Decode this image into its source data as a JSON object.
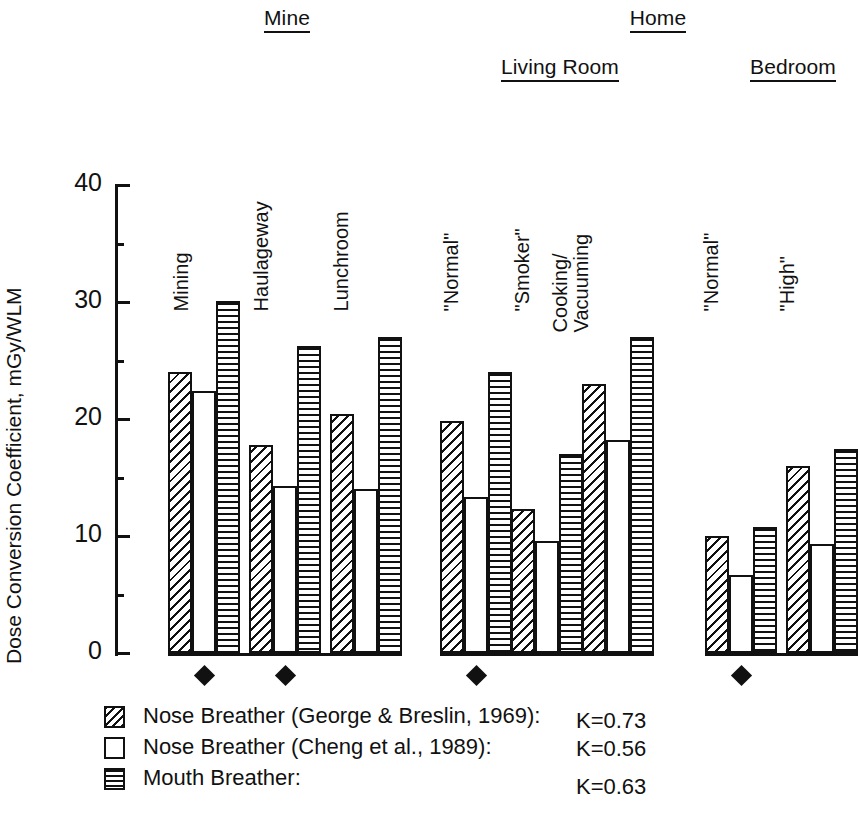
{
  "chart_data": {
    "type": "bar",
    "title": "",
    "xlabel": "",
    "ylabel": "Dose Conversion Coefficient, mGy/WLM",
    "ylim": [
      0,
      40
    ],
    "yticks": [
      0,
      10,
      20,
      30,
      40
    ],
    "yminor": [
      5,
      15,
      25,
      35
    ],
    "grid": false,
    "legend_position": "bottom-left",
    "categories": [
      "Mining",
      "Haulageway",
      "Lunchroom",
      "\"Normal\"",
      "\"Smoker\"",
      "Cooking/ Vacuuming",
      "\"Normal\"",
      "\"High\""
    ],
    "supergroups": [
      {
        "label": "Mine",
        "categories": [
          "Mining",
          "Haulageway",
          "Lunchroom"
        ]
      },
      {
        "label": "Home",
        "subgroups": [
          {
            "label": "Living Room",
            "categories": [
              "\"Normal\"",
              "\"Smoker\"",
              "Cooking/ Vacuuming"
            ]
          },
          {
            "label": "Bedroom",
            "categories": [
              "\"Normal\"",
              "\"High\""
            ]
          }
        ]
      }
    ],
    "series": [
      {
        "name": "Nose Breather (George & Breslin, 1969)",
        "pattern": "diagonal-hatch",
        "k": 0.73,
        "values": [
          24.0,
          17.8,
          20.4,
          19.8,
          12.3,
          23.0,
          10.0,
          16.0
        ]
      },
      {
        "name": "Nose Breather (Cheng et al., 1989)",
        "pattern": "open-white",
        "k": 0.56,
        "values": [
          22.4,
          14.3,
          14.0,
          13.3,
          9.6,
          18.2,
          6.7,
          9.3
        ]
      },
      {
        "name": "Mouth Breather",
        "pattern": "horizontal-stripe",
        "k": 0.63,
        "values": [
          30.1,
          26.2,
          27.0,
          24.0,
          17.0,
          27.0,
          10.8,
          17.4
        ]
      }
    ],
    "marker_note": "diamond marker below groups",
    "markers": [
      {
        "category_index": 0,
        "symbol": "diamond"
      },
      {
        "category_index": 1,
        "symbol": "diamond"
      },
      {
        "category_index": 3,
        "symbol": "diamond"
      },
      {
        "category_index": 6,
        "symbol": "diamond"
      }
    ]
  },
  "headers": {
    "mine": "Mine",
    "home": "Home",
    "living_room": "Living Room",
    "bedroom": "Bedroom"
  },
  "axis": {
    "y_title": "Dose Conversion Coefficient, mGy/WLM",
    "tick_40": "40",
    "tick_30": "30",
    "tick_20": "20",
    "tick_10": "10",
    "tick_0": "0"
  },
  "cat_labels": {
    "mining": "Mining",
    "haulageway": "Haulageway",
    "lunchroom": "Lunchroom",
    "lr_normal": "\"Normal\"",
    "lr_smoker": "\"Smoker\"",
    "cooking": "Cooking/",
    "vacuuming": "Vacuuming",
    "bd_normal": "\"Normal\"",
    "bd_high": "\"High\""
  },
  "legend": {
    "rows": [
      {
        "label": "Nose Breather (George & Breslin, 1969):",
        "k": "K=0.73",
        "swatch": "diagonal-hatch-swatch"
      },
      {
        "label": "Nose Breather (Cheng et al., 1989):",
        "k": "K=0.56",
        "swatch": "open-white-swatch"
      },
      {
        "label": "Mouth Breather:",
        "k": "K=0.63",
        "swatch": "horizontal-stripe-swatch"
      }
    ]
  }
}
